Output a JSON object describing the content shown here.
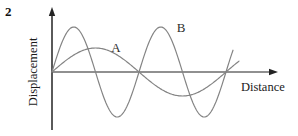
{
  "question_number": "2",
  "figure": {
    "background_color": "#ffffff",
    "axes": {
      "color": "#232323",
      "origin_px": {
        "x": 52,
        "y": 72
      },
      "x_axis_tip_px": 278,
      "y_axis_tip_px": 7,
      "y_axis_bottom_px": 130
    },
    "waves": [
      {
        "label": "A",
        "color": "#848484",
        "amplitude_px": 24,
        "wavelength_px": 174,
        "start_x_px": 52,
        "end_x_px": 239,
        "label_center_px": {
          "x": 116,
          "y": 47
        }
      },
      {
        "label": "B",
        "color": "#848484",
        "amplitude_px": 45,
        "wavelength_px": 87,
        "start_x_px": 52,
        "end_x_px": 233,
        "label_center_px": {
          "x": 181,
          "y": 27
        }
      }
    ]
  },
  "chart_data": {
    "type": "line",
    "title": "",
    "xlabel": "Distance",
    "ylabel": "Displacement",
    "x_tick_labels": [],
    "y_tick_labels": [],
    "grid": false,
    "legend_position": "inline-curve-labels",
    "x_range": [
      0,
      2.15
    ],
    "y_range": [
      -1.9,
      1.9
    ],
    "x_unit": "wavelengths of B (no numeric scale shown)",
    "y_unit": "amplitudes of A (no numeric scale shown)",
    "series": [
      {
        "name": "A",
        "shape": "sine",
        "amplitude": 1.0,
        "wavelength": 2.0,
        "phase": 0,
        "equation": "y = 1.0 * sin(pi * x)",
        "zero_crossings_x": [
          0,
          1.0,
          2.0
        ],
        "peak_xy": [
          0.5,
          1.0
        ],
        "trough_xy": [
          1.5,
          -1.0
        ]
      },
      {
        "name": "B",
        "shape": "sine",
        "amplitude": 1.9,
        "wavelength": 1.0,
        "phase": 0,
        "equation": "y = 1.9 * sin(2 * pi * x)",
        "zero_crossings_x": [
          0,
          0.5,
          1.0,
          1.5,
          2.0
        ],
        "peak_xy": [
          0.25,
          1.9
        ],
        "trough_xy": [
          0.75,
          -1.9
        ]
      }
    ]
  }
}
